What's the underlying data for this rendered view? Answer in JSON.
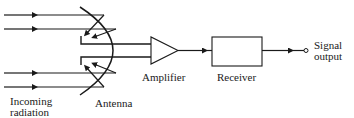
{
  "diagram": {
    "labels": {
      "incoming": [
        "Incoming",
        "radiation"
      ],
      "antenna": "Antenna",
      "amplifier": "Amplifier",
      "receiver": "Receiver",
      "output": [
        "Signal",
        "output"
      ]
    },
    "nodes": [
      {
        "id": "antenna",
        "shape": "parabolic-dish"
      },
      {
        "id": "amplifier",
        "shape": "triangle"
      },
      {
        "id": "receiver",
        "shape": "rectangle"
      },
      {
        "id": "signal-output",
        "shape": "open-circle"
      }
    ],
    "edges": [
      {
        "from": "incoming-radiation",
        "to": "antenna",
        "count": 4
      },
      {
        "from": "antenna",
        "to": "amplifier"
      },
      {
        "from": "amplifier",
        "to": "receiver"
      },
      {
        "from": "receiver",
        "to": "signal-output"
      }
    ],
    "colors": {
      "stroke": "#1a1a1a",
      "background": "#ffffff"
    }
  }
}
